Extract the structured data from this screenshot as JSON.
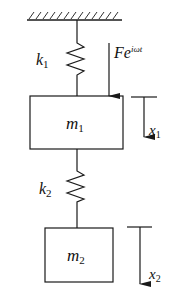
{
  "diagram": {
    "type": "two-degree-of-freedom spring-mass system",
    "ground": {
      "label": ""
    },
    "springs": [
      {
        "id": "k1",
        "label": "k",
        "subscript": "1",
        "connects": [
          "ground",
          "m1"
        ]
      },
      {
        "id": "k2",
        "label": "k",
        "subscript": "2",
        "connects": [
          "m1",
          "m2"
        ]
      }
    ],
    "masses": [
      {
        "id": "m1",
        "label": "m",
        "subscript": "1"
      },
      {
        "id": "m2",
        "label": "m",
        "subscript": "2"
      }
    ],
    "force": {
      "label": "Fe",
      "superscript": "iωt",
      "applied_to": "m1",
      "direction": "down"
    },
    "displacements": [
      {
        "id": "x1",
        "label": "x",
        "subscript": "1",
        "mass": "m1",
        "direction": "down"
      },
      {
        "id": "x2",
        "label": "x",
        "subscript": "2",
        "mass": "m2",
        "direction": "down"
      }
    ]
  }
}
